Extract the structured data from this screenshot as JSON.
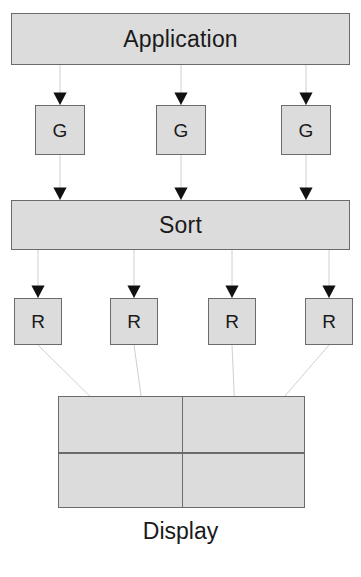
{
  "diagram": {
    "title_caption": "Display",
    "application": {
      "label": "Application",
      "x": 11,
      "y": 13,
      "w": 339,
      "h": 52
    },
    "sort": {
      "label": "Sort",
      "x": 11,
      "y": 200,
      "w": 339,
      "h": 50
    },
    "generators": [
      {
        "label": "G",
        "x": 35,
        "y": 105,
        "w": 50,
        "h": 50
      },
      {
        "label": "G",
        "x": 156,
        "y": 105,
        "w": 50,
        "h": 50
      },
      {
        "label": "G",
        "x": 281,
        "y": 105,
        "w": 50,
        "h": 50
      }
    ],
    "renderers": [
      {
        "label": "R",
        "x": 14,
        "y": 298,
        "w": 48,
        "h": 47
      },
      {
        "label": "R",
        "x": 110,
        "y": 298,
        "w": 48,
        "h": 47
      },
      {
        "label": "R",
        "x": 208,
        "y": 298,
        "w": 48,
        "h": 47
      },
      {
        "label": "R",
        "x": 305,
        "y": 298,
        "w": 48,
        "h": 47
      }
    ],
    "display": {
      "x": 58,
      "y": 396,
      "w": 247,
      "h": 112,
      "columns": 2,
      "rows": 2,
      "tiles": [
        {
          "name": "tile-top-left",
          "arrow": "left-arrow-glyph",
          "glyph": "◀",
          "cx": 120,
          "cy": 426
        },
        {
          "name": "tile-top-right",
          "arrow": "right-arrow-glyph",
          "glyph": "▶",
          "cx": 259,
          "cy": 426
        },
        {
          "name": "tile-bottom-left",
          "arrow": "down-arrow-glyph",
          "glyph": "▼",
          "cx": 153,
          "cy": 481
        },
        {
          "name": "tile-bottom-right",
          "arrow": "down-arrow-glyph",
          "glyph": "▼",
          "cx": 238,
          "cy": 481
        }
      ]
    },
    "colors": {
      "node_fill": "#dcdcdc",
      "node_border": "#6b6b6b",
      "wire": "#d0d0d0",
      "arrowhead": "#111111",
      "text": "#1a1a1a",
      "background": "#ffffff"
    },
    "connections": {
      "application_to_generators": [
        {
          "from": "application",
          "to": "generator-1",
          "x1": 60,
          "y1": 65,
          "x2": 60,
          "y2": 105
        },
        {
          "from": "application",
          "to": "generator-2",
          "x1": 181,
          "y1": 65,
          "x2": 181,
          "y2": 105
        },
        {
          "from": "application",
          "to": "generator-3",
          "x1": 306,
          "y1": 65,
          "x2": 306,
          "y2": 105
        }
      ],
      "generators_to_sort": [
        {
          "from": "generator-1",
          "to": "sort",
          "x1": 60,
          "y1": 155,
          "x2": 60,
          "y2": 200
        },
        {
          "from": "generator-2",
          "to": "sort",
          "x1": 181,
          "y1": 155,
          "x2": 181,
          "y2": 200
        },
        {
          "from": "generator-3",
          "to": "sort",
          "x1": 306,
          "y1": 155,
          "x2": 306,
          "y2": 200
        }
      ],
      "sort_to_renderers": [
        {
          "from": "sort",
          "to": "renderer-1",
          "x1": 38,
          "y1": 250,
          "x2": 38,
          "y2": 298
        },
        {
          "from": "sort",
          "to": "renderer-2",
          "x1": 134,
          "y1": 250,
          "x2": 134,
          "y2": 298
        },
        {
          "from": "sort",
          "to": "renderer-3",
          "x1": 232,
          "y1": 250,
          "x2": 232,
          "y2": 298
        },
        {
          "from": "sort",
          "to": "renderer-4",
          "x1": 329,
          "y1": 250,
          "x2": 329,
          "y2": 298
        }
      ],
      "renderers_to_display": [
        {
          "from": "renderer-1",
          "to": "tile-top-left",
          "x1": 38,
          "y1": 345,
          "x2": 120,
          "y2": 426
        },
        {
          "from": "renderer-2",
          "to": "tile-bottom-left",
          "x1": 134,
          "y1": 345,
          "x2": 153,
          "y2": 481
        },
        {
          "from": "renderer-3",
          "to": "tile-bottom-right",
          "x1": 232,
          "y1": 345,
          "x2": 238,
          "y2": 481
        },
        {
          "from": "renderer-4",
          "to": "tile-top-right",
          "x1": 329,
          "y1": 345,
          "x2": 259,
          "y2": 426
        }
      ]
    },
    "caption": {
      "text": "Display",
      "y": 518
    }
  }
}
